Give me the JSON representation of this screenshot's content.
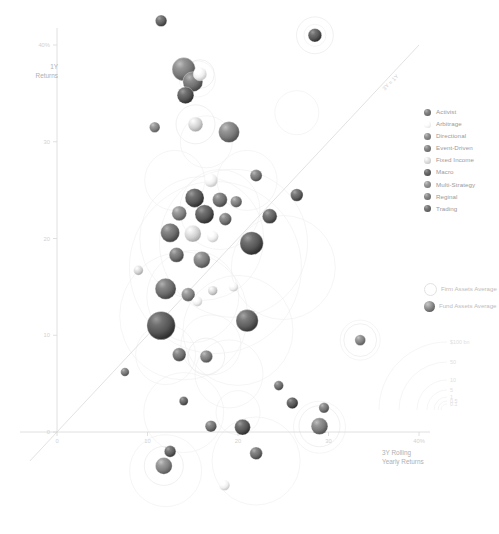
{
  "chart_data": {
    "type": "scatter",
    "title": "",
    "xlabel": "3Y Rolling Yearly Returns",
    "ylabel": "1Y Returns",
    "xlim": [
      -3,
      44
    ],
    "ylim": [
      -9,
      44
    ],
    "x_ticks": [
      "0",
      "10",
      "20",
      "30",
      "40%"
    ],
    "x_tick_values": [
      0,
      10,
      20,
      30,
      40
    ],
    "y_ticks": [
      "0",
      "10",
      "20",
      "30",
      "40%"
    ],
    "y_tick_values": [
      0,
      10,
      20,
      30,
      40
    ],
    "grid": false,
    "legend_position": "right",
    "annotations": [
      {
        "text": "3Y = 1Y",
        "x": 37,
        "y": 36,
        "rotation": -45
      }
    ],
    "reference_line": {
      "label": "3Y = 1Y",
      "type": "identity",
      "from": [
        -3,
        -3
      ],
      "to": [
        40,
        40
      ]
    },
    "size_encoding": {
      "outline_series": "Firm Assets Average",
      "filled_series": "Fund Assets Average",
      "scale_ticks": [
        "$100 bn",
        "50",
        "10",
        "5",
        "1",
        "0.5",
        "0.1"
      ]
    },
    "series": [
      {
        "name": "Activist",
        "color": "#6b6b6b"
      },
      {
        "name": "Arbitrage",
        "color": "#efefef"
      },
      {
        "name": "Directional",
        "color": "#7a7a7a"
      },
      {
        "name": "Event-Driven",
        "color": "#6f6f6f"
      },
      {
        "name": "Fixed Income",
        "color": "#cfcfcf"
      },
      {
        "name": "Macro",
        "color": "#555555"
      },
      {
        "name": "Multi-Strategy",
        "color": "#818181"
      },
      {
        "name": "Reginal",
        "color": "#737373"
      },
      {
        "name": "Trading",
        "color": "#5f5f5f"
      }
    ],
    "points": [
      {
        "x": 11.5,
        "y": 42.5,
        "fund": 4.0,
        "firm": 0,
        "cat": "Trading"
      },
      {
        "x": 28.5,
        "y": 41.0,
        "fund": 5.0,
        "firm": 9.0,
        "cat": "Macro"
      },
      {
        "x": 14.0,
        "y": 37.5,
        "fund": 9.5,
        "firm": 0,
        "cat": "Directional"
      },
      {
        "x": 15.0,
        "y": 36.2,
        "fund": 8.0,
        "firm": 0,
        "cat": "Event-Driven"
      },
      {
        "x": 15.8,
        "y": 37.0,
        "fund": 5.0,
        "firm": 7.0,
        "cat": "Arbitrage"
      },
      {
        "x": 14.2,
        "y": 34.8,
        "fund": 6.5,
        "firm": 0,
        "cat": "Macro"
      },
      {
        "x": 10.8,
        "y": 31.5,
        "fund": 3.5,
        "firm": 0,
        "cat": "Multi-Strategy"
      },
      {
        "x": 15.3,
        "y": 31.8,
        "fund": 5.5,
        "firm": 9.5,
        "cat": "Fixed Income"
      },
      {
        "x": 19.0,
        "y": 31.0,
        "fund": 8.5,
        "firm": 0,
        "cat": "Directional"
      },
      {
        "x": 22.0,
        "y": 26.5,
        "fund": 4.2,
        "firm": 0,
        "cat": "Reginal"
      },
      {
        "x": 17.0,
        "y": 26.0,
        "fund": 5.0,
        "firm": 0,
        "cat": "Arbitrage"
      },
      {
        "x": 26.5,
        "y": 24.5,
        "fund": 4.5,
        "firm": 0,
        "cat": "Trading"
      },
      {
        "x": 15.2,
        "y": 24.2,
        "fund": 7.5,
        "firm": 0,
        "cat": "Macro"
      },
      {
        "x": 18.0,
        "y": 24.0,
        "fund": 5.5,
        "firm": 0,
        "cat": "Event-Driven"
      },
      {
        "x": 19.8,
        "y": 23.8,
        "fund": 4.0,
        "firm": 0,
        "cat": "Directional"
      },
      {
        "x": 13.5,
        "y": 22.6,
        "fund": 5.5,
        "firm": 0,
        "cat": "Multi-Strategy"
      },
      {
        "x": 16.3,
        "y": 22.5,
        "fund": 7.5,
        "firm": 0,
        "cat": "Macro"
      },
      {
        "x": 18.6,
        "y": 22.0,
        "fund": 4.5,
        "firm": 0,
        "cat": "Reginal"
      },
      {
        "x": 23.5,
        "y": 22.3,
        "fund": 5.5,
        "firm": 0,
        "cat": "Trading"
      },
      {
        "x": 12.5,
        "y": 20.6,
        "fund": 7.5,
        "firm": 0,
        "cat": "Activist"
      },
      {
        "x": 15.0,
        "y": 20.5,
        "fund": 6.5,
        "firm": 0,
        "cat": "Fixed Income"
      },
      {
        "x": 17.2,
        "y": 20.2,
        "fund": 4.0,
        "firm": 0,
        "cat": "Arbitrage"
      },
      {
        "x": 21.5,
        "y": 19.5,
        "fund": 9.5,
        "firm": 0,
        "cat": "Macro"
      },
      {
        "x": 13.2,
        "y": 18.3,
        "fund": 5.5,
        "firm": 0,
        "cat": "Event-Driven"
      },
      {
        "x": 16.0,
        "y": 17.8,
        "fund": 6.5,
        "firm": 0,
        "cat": "Directional"
      },
      {
        "x": 9.0,
        "y": 16.7,
        "fund": 3.0,
        "firm": 0,
        "cat": "Fixed Income"
      },
      {
        "x": 12.0,
        "y": 14.8,
        "fund": 8.5,
        "firm": 0,
        "cat": "Activist"
      },
      {
        "x": 14.5,
        "y": 14.2,
        "fund": 5.0,
        "firm": 0,
        "cat": "Multi-Strategy"
      },
      {
        "x": 15.5,
        "y": 13.5,
        "fund": 3.2,
        "firm": 0,
        "cat": "Arbitrage"
      },
      {
        "x": 17.2,
        "y": 14.6,
        "fund": 3.0,
        "firm": 0,
        "cat": "Fixed Income"
      },
      {
        "x": 19.5,
        "y": 15.0,
        "fund": 3.0,
        "firm": 0,
        "cat": "Arbitrage"
      },
      {
        "x": 11.5,
        "y": 11.0,
        "fund": 12.0,
        "firm": 0,
        "cat": "Macro"
      },
      {
        "x": 21.0,
        "y": 11.5,
        "fund": 9.0,
        "firm": 0,
        "cat": "Trading"
      },
      {
        "x": 13.5,
        "y": 8.0,
        "fund": 5.0,
        "firm": 0,
        "cat": "Event-Driven"
      },
      {
        "x": 16.5,
        "y": 7.8,
        "fund": 4.5,
        "firm": 9.0,
        "cat": "Directional"
      },
      {
        "x": 7.5,
        "y": 6.2,
        "fund": 2.6,
        "firm": 0,
        "cat": "Reginal"
      },
      {
        "x": 33.5,
        "y": 9.5,
        "fund": 3.6,
        "firm": 8.0,
        "cat": "Multi-Strategy"
      },
      {
        "x": 14.0,
        "y": 3.2,
        "fund": 2.8,
        "firm": 0,
        "cat": "Trading"
      },
      {
        "x": 24.5,
        "y": 4.8,
        "fund": 3.0,
        "firm": 0,
        "cat": "Activist"
      },
      {
        "x": 26.0,
        "y": 3.0,
        "fund": 4.0,
        "firm": 0,
        "cat": "Macro"
      },
      {
        "x": 29.5,
        "y": 2.5,
        "fund": 3.4,
        "firm": 0,
        "cat": "Reginal"
      },
      {
        "x": 17.0,
        "y": 0.6,
        "fund": 4.0,
        "firm": 0,
        "cat": "Event-Driven"
      },
      {
        "x": 20.5,
        "y": 0.5,
        "fund": 6.0,
        "firm": 0,
        "cat": "Macro"
      },
      {
        "x": 29.0,
        "y": 0.6,
        "fund": 6.5,
        "firm": 10.0,
        "cat": "Directional"
      },
      {
        "x": 12.5,
        "y": -2.0,
        "fund": 4.0,
        "firm": 0,
        "cat": "Trading"
      },
      {
        "x": 11.8,
        "y": -3.5,
        "fund": 6.5,
        "firm": 9.5,
        "cat": "Multi-Strategy"
      },
      {
        "x": 22.0,
        "y": -2.2,
        "fund": 4.5,
        "firm": 0,
        "cat": "Activist"
      },
      {
        "x": 18.5,
        "y": -5.5,
        "fund": 3.6,
        "firm": 0,
        "cat": "Arbitrage"
      }
    ]
  },
  "axes": {
    "y_title": "1Y\nReturns",
    "x_title": "3Y Rolling\nYearly Returns"
  },
  "legend": {
    "items": [
      {
        "label": "Activist"
      },
      {
        "label": "Arbitrage"
      },
      {
        "label": "Directional"
      },
      {
        "label": "Event-Driven"
      },
      {
        "label": "Fixed Income"
      },
      {
        "label": "Macro"
      },
      {
        "label": "Multi-Strategy"
      },
      {
        "label": "Reginal"
      },
      {
        "label": "Trading"
      }
    ]
  },
  "size_legend": {
    "firm_label": "Firm Assets\nAverage",
    "fund_label": "Fund Assets\nAverage",
    "ticks": [
      "$100 bn",
      "50",
      "10",
      "5",
      "1",
      "0.5",
      "0.1"
    ]
  }
}
